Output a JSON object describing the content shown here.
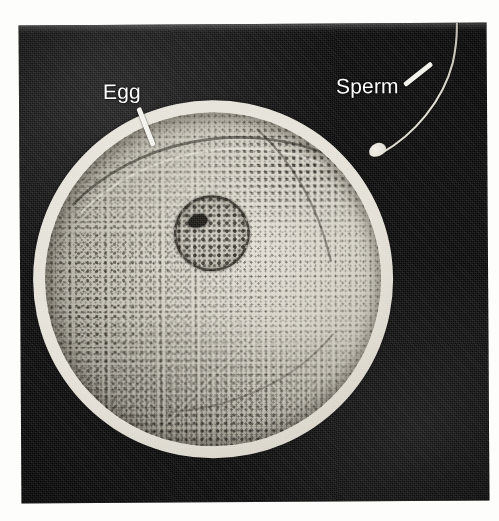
{
  "page": {
    "background_color": "#fdfdfb",
    "cut_off_text_top": "and a"
  },
  "figure": {
    "kind": "photomicrograph",
    "photo_background_color": "#0a0a0a",
    "label_text_color": "#ffffff",
    "leader_line_color": "#f4f2ec",
    "labels": [
      {
        "name": "egg",
        "text": "Egg",
        "points_to": "outer bright ring (zona pellucida) at upper-left of the egg"
      },
      {
        "name": "sperm",
        "text": "Sperm",
        "points_to": "small bright sperm head touching the egg surface at upper right"
      }
    ],
    "structures": [
      {
        "name": "zona-pellucida",
        "color": "#e4e0d6"
      },
      {
        "name": "cytoplasm",
        "color": "#c3bfb3"
      },
      {
        "name": "nucleus",
        "color": "#c0bcb0"
      },
      {
        "name": "nucleolus",
        "color": "#1b1914"
      },
      {
        "name": "sperm-head",
        "color": "#e3e0d7"
      },
      {
        "name": "sperm-tail",
        "color": "#dedacf"
      }
    ]
  }
}
